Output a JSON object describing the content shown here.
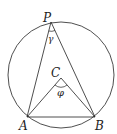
{
  "diagram": {
    "type": "inscribed-angle-geometry",
    "circle": {
      "cx": 61,
      "cy": 75,
      "r": 53
    },
    "points": {
      "P": {
        "x": 51,
        "y": 22,
        "label": "P"
      },
      "A": {
        "x": 27,
        "y": 117,
        "label": "A"
      },
      "B": {
        "x": 95,
        "y": 117,
        "label": "B"
      },
      "C": {
        "x": 61,
        "y": 78,
        "label": "C"
      }
    },
    "angles": {
      "gamma": {
        "label": "γ",
        "vertex": "P"
      },
      "phi": {
        "label": "φ",
        "vertex": "C"
      }
    },
    "stroke_color": "#222222"
  }
}
